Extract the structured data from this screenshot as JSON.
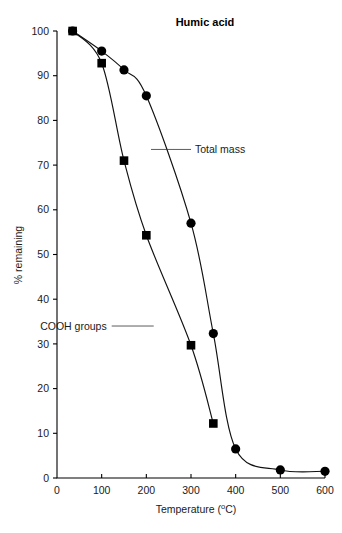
{
  "chart_data": {
    "type": "line",
    "title": "Humic acid",
    "xlabel": "Temperature (oC)",
    "xlabel_main": "Temperature (",
    "xlabel_sup": "o",
    "xlabel_tail": "C)",
    "ylabel": "% remaining",
    "xlim": [
      0,
      600
    ],
    "ylim": [
      0,
      100
    ],
    "xticks": [
      0,
      100,
      200,
      300,
      400,
      500,
      600
    ],
    "yticks": [
      0,
      10,
      20,
      30,
      40,
      50,
      60,
      70,
      80,
      90,
      100
    ],
    "grid": false,
    "legend_position": "inline-annotations",
    "series": [
      {
        "name": "Total mass",
        "marker": "filled-circle",
        "x": [
          35,
          100,
          150,
          200,
          300,
          350,
          400,
          500,
          600
        ],
        "values": [
          100,
          95.5,
          91.3,
          85.5,
          57.0,
          32.3,
          6.5,
          1.8,
          1.5
        ]
      },
      {
        "name": "COOH groups",
        "marker": "filled-square",
        "x": [
          35,
          100,
          150,
          200,
          300,
          350
        ],
        "values": [
          100,
          92.8,
          71.0,
          54.3,
          29.7,
          12.2
        ]
      }
    ],
    "annotations": [
      {
        "text": "Total mass",
        "anchor_x": 300,
        "anchor_y": 73.5
      },
      {
        "text": "COOH groups",
        "anchor_x": 118,
        "anchor_y": 34.0
      }
    ]
  },
  "axis": {
    "x_tick_labels": [
      "0",
      "100",
      "200",
      "300",
      "400",
      "500",
      "600"
    ],
    "y_tick_labels": [
      "0",
      "10",
      "20",
      "30",
      "40",
      "50",
      "60",
      "70",
      "80",
      "90",
      "100"
    ]
  }
}
